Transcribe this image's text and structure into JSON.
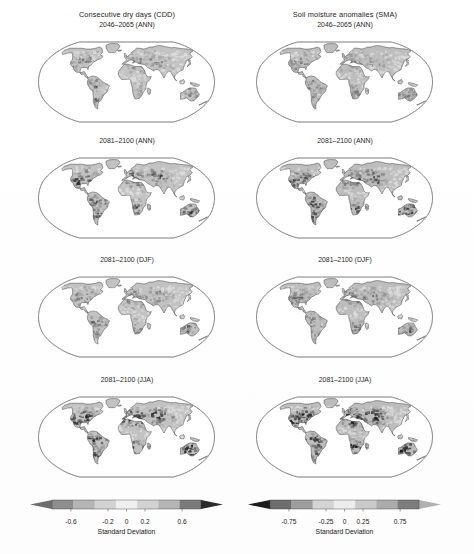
{
  "figure": {
    "columns": [
      {
        "id": "cdd",
        "title": "Consecutive dry days (CDD)",
        "panels": [
          {
            "label": "2046–2065 (ANN)",
            "period": "2046-2065",
            "season": "ANN"
          },
          {
            "label": "2081–2100 (ANN)",
            "period": "2081-2100",
            "season": "ANN"
          },
          {
            "label": "2081–2100 (DJF)",
            "period": "2081-2100",
            "season": "DJF"
          },
          {
            "label": "2081–2100 (JJA)",
            "period": "2081-2100",
            "season": "JJA"
          }
        ],
        "colorbar": {
          "axis_label": "Standard Deviation",
          "ticks": [
            "-0.6",
            "-0.2",
            "0",
            "0.2",
            "0.6"
          ],
          "tick_values": [
            -0.6,
            -0.2,
            0,
            0.2,
            0.6
          ],
          "extend": "both",
          "polarity": "light-center",
          "colors": [
            "#6f6f6f",
            "#8e8e8e",
            "#b5b5b5",
            "#d2d2d2",
            "#efefef",
            "#d2d2d2",
            "#b5b5b5",
            "#7a7a7a",
            "#2b2b2b"
          ]
        }
      },
      {
        "id": "sma",
        "title": "Soil moisture anomalies (SMA)",
        "panels": [
          {
            "label": "2046–2065 (ANN)",
            "period": "2046-2065",
            "season": "ANN"
          },
          {
            "label": "2081–2100 (ANN)",
            "period": "2081-2100",
            "season": "ANN"
          },
          {
            "label": "2081–2100 (DJF)",
            "period": "2081-2100",
            "season": "DJF"
          },
          {
            "label": "2081–2100 (JJA)",
            "period": "2081-2100",
            "season": "JJA"
          }
        ],
        "colorbar": {
          "axis_label": "Standard Deviation",
          "ticks": [
            "-0.75",
            "-0.25",
            "0",
            "0.25",
            "0.75"
          ],
          "tick_values": [
            -0.75,
            -0.25,
            0,
            0.25,
            0.75
          ],
          "extend": "both",
          "polarity": "dark-left",
          "colors": [
            "#1d1d1d",
            "#6e6e6e",
            "#9d9d9d",
            "#d4d4d4",
            "#ededed",
            "#c9c9c9",
            "#ababab",
            "#7d7d7d",
            "#b0b0b0"
          ]
        }
      }
    ],
    "projection": "robinson",
    "map_style": {
      "ocean": "#ffffff",
      "outline": "#7a7a7a",
      "land_stroke": "#5a5a5a",
      "background": "#ffffff"
    }
  },
  "chart_data": {
    "type": "heatmap",
    "panel_grid": {
      "rows": 4,
      "cols": 2
    },
    "row_labels": [
      "2046–2065 (ANN)",
      "2081–2100 (ANN)",
      "2081–2100 (DJF)",
      "2081–2100 (JJA)"
    ],
    "col_labels": [
      "Consecutive dry days (CDD)",
      "Soil moisture anomalies (SMA)"
    ],
    "variable": "Standard Deviation",
    "colorbars": [
      {
        "for": "Consecutive dry days (CDD)",
        "ticks": [
          -0.6,
          -0.2,
          0,
          0.2,
          0.6
        ],
        "range": [
          -0.8,
          0.8
        ],
        "extend": "both",
        "label": "Standard Deviation"
      },
      {
        "for": "Soil moisture anomalies (SMA)",
        "ticks": [
          -0.75,
          -0.25,
          0,
          0.25,
          0.75
        ],
        "range": [
          -1.0,
          1.0
        ],
        "extend": "both",
        "label": "Standard Deviation"
      }
    ],
    "grid": false,
    "legend_position": "bottom",
    "colormap": "grayscale-diverging",
    "regions": [
      {
        "name": "North America",
        "cdd_ann_2046": 0.2,
        "cdd_ann_2081": 0.45,
        "cdd_djf_2081": 0.2,
        "cdd_jja_2081": 0.7,
        "sma_ann_2046": -0.3,
        "sma_ann_2081": -0.6,
        "sma_djf_2081": -0.25,
        "sma_jja_2081": -0.8
      },
      {
        "name": "South America",
        "cdd_ann_2046": 0.25,
        "cdd_ann_2081": 0.5,
        "cdd_djf_2081": 0.35,
        "cdd_jja_2081": 0.55,
        "sma_ann_2046": -0.35,
        "sma_ann_2081": -0.65,
        "sma_djf_2081": -0.4,
        "sma_jja_2081": -0.6
      },
      {
        "name": "Europe / Mediterranean",
        "cdd_ann_2046": 0.4,
        "cdd_ann_2081": 0.7,
        "cdd_djf_2081": 0.3,
        "cdd_jja_2081": 0.8,
        "sma_ann_2046": -0.5,
        "sma_ann_2081": -0.85,
        "sma_djf_2081": -0.35,
        "sma_jja_2081": -0.95
      },
      {
        "name": "Africa",
        "cdd_ann_2046": 0.2,
        "cdd_ann_2081": 0.4,
        "cdd_djf_2081": 0.25,
        "cdd_jja_2081": 0.45,
        "sma_ann_2046": -0.25,
        "sma_ann_2081": -0.5,
        "sma_djf_2081": -0.3,
        "sma_jja_2081": -0.55
      },
      {
        "name": "Asia",
        "cdd_ann_2046": 0.15,
        "cdd_ann_2081": 0.35,
        "cdd_djf_2081": 0.2,
        "cdd_jja_2081": 0.4,
        "sma_ann_2046": -0.2,
        "sma_ann_2081": -0.45,
        "sma_djf_2081": -0.2,
        "sma_jja_2081": -0.5
      },
      {
        "name": "Australia",
        "cdd_ann_2046": 0.2,
        "cdd_ann_2081": 0.4,
        "cdd_djf_2081": 0.3,
        "cdd_jja_2081": 0.35,
        "sma_ann_2046": -0.3,
        "sma_ann_2081": -0.55,
        "sma_djf_2081": -0.45,
        "sma_jja_2081": -0.4
      }
    ]
  }
}
